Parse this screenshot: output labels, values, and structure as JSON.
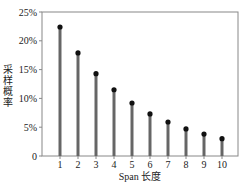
{
  "chart_data": {
    "type": "bar",
    "style": "stem",
    "title": "",
    "xlabel": "Span 长度",
    "ylabel": "采样概率",
    "categories": [
      "1",
      "2",
      "3",
      "4",
      "5",
      "6",
      "7",
      "8",
      "9",
      "10"
    ],
    "values": [
      22.4,
      17.9,
      14.3,
      11.5,
      9.2,
      7.3,
      5.9,
      4.7,
      3.8,
      3.0
    ],
    "value_unit": "%",
    "ylim": [
      0,
      25
    ],
    "yticks": [
      0,
      5,
      10,
      15,
      20,
      25
    ],
    "ytick_labels": [
      "0",
      "5%",
      "10%",
      "15%",
      "20%",
      "25%"
    ],
    "grid": false,
    "legend": null,
    "colors": {
      "stem": "#666666",
      "marker": "#111111",
      "frame": "#888888"
    }
  }
}
